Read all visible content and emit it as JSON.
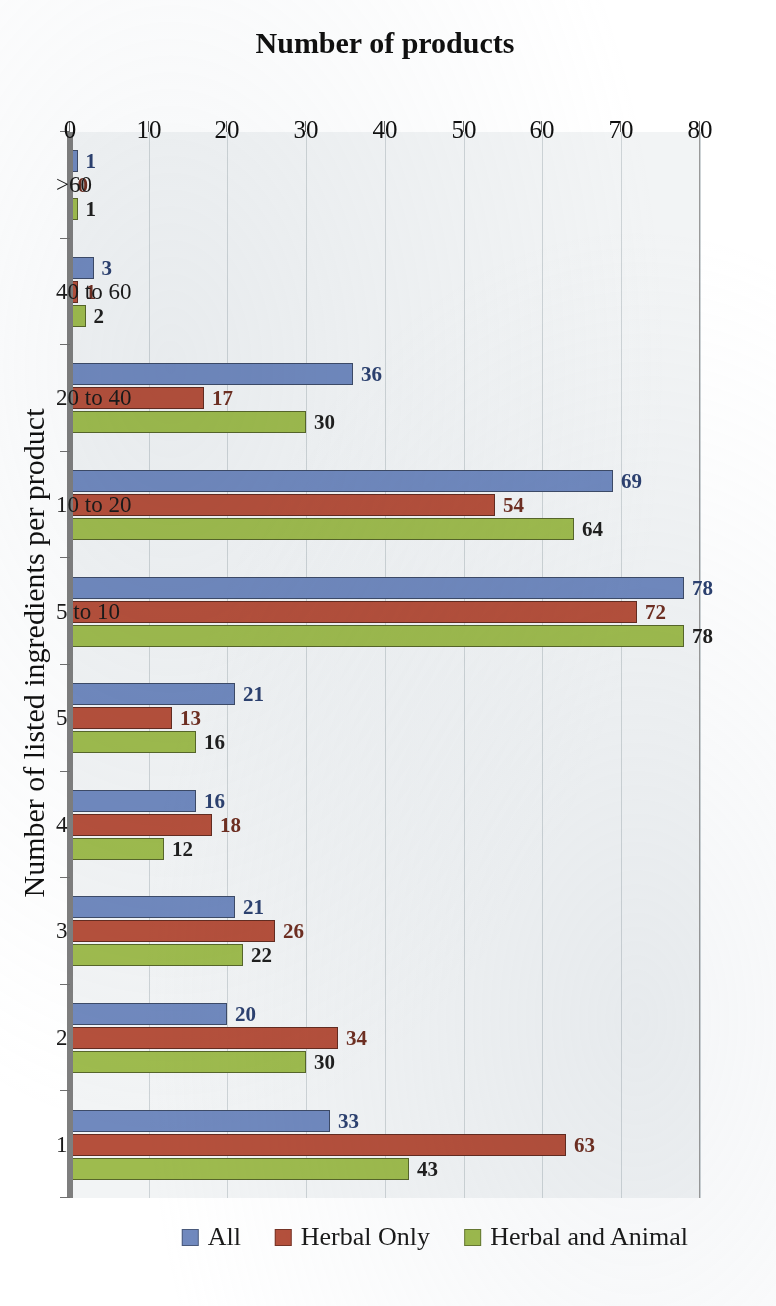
{
  "chart_data": {
    "type": "bar",
    "orientation": "horizontal",
    "title": "",
    "xlabel": "Number of listed ingredients per product",
    "ylabel": "Number of products",
    "categories": [
      "1",
      "2",
      "3",
      "4",
      "5",
      "5 to 10",
      "10 to 20",
      "20 to 40",
      "40 to 60",
      ">60"
    ],
    "categories_note": "axis shows 9 labelled groups",
    "series": [
      {
        "name": "All",
        "color": "#7089be",
        "values": [
          33,
          20,
          21,
          16,
          21,
          78,
          69,
          36,
          3,
          1
        ]
      },
      {
        "name": "Herbal Only",
        "color": "#b5503c",
        "values": [
          63,
          34,
          26,
          18,
          13,
          72,
          54,
          17,
          1,
          0
        ]
      },
      {
        "name": "Herbal and Animal",
        "color": "#9ebb4e",
        "values": [
          43,
          30,
          22,
          12,
          16,
          78,
          64,
          30,
          2,
          1
        ]
      }
    ],
    "value_axis": {
      "ticks": [
        "0",
        "10",
        "20",
        "30",
        "40",
        "50",
        "60",
        "70",
        "80"
      ],
      "min": 0,
      "max": 80,
      "step": 10
    },
    "grid": true,
    "legend_position": "top",
    "data_labels": true,
    "plot_background": "#f2f4f5",
    "rotation": "180deg"
  },
  "legend": {
    "entries": [
      {
        "label": "All",
        "color": "#7089be"
      },
      {
        "label": "Herbal Only",
        "color": "#b5503c"
      },
      {
        "label": "Herbal and Animal",
        "color": "#9ebb4e"
      }
    ]
  },
  "axes": {
    "x_title": "Number of listed ingredients per product",
    "y_title": "Number of products",
    "value_ticks": [
      "0",
      "10",
      "20",
      "30",
      "40",
      "50",
      "60",
      "70",
      "80"
    ],
    "category_ticks": [
      "1",
      "2",
      "3",
      "4",
      "5",
      "5 to 10",
      "10 to 20",
      "20 to 40",
      "40 to 60",
      ">60"
    ]
  }
}
